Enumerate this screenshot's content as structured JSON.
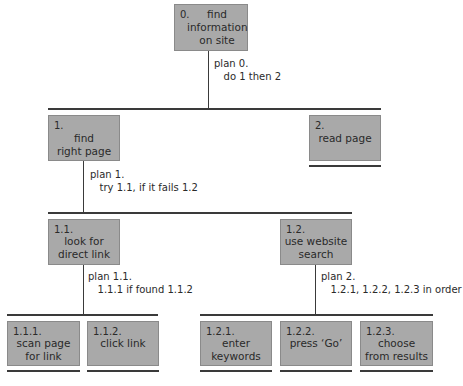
{
  "diagram": {
    "type": "hierarchical task analysis",
    "nodes": {
      "n0": {
        "num": "0.",
        "label": "find\ninformation\non site"
      },
      "n1": {
        "num": "1.",
        "label": "find\nright page"
      },
      "n2": {
        "num": "2.",
        "label": "read page"
      },
      "n11": {
        "num": "1.1.",
        "label": "look for\ndirect link"
      },
      "n12": {
        "num": "1.2.",
        "label": "use website\nsearch"
      },
      "n111": {
        "num": "1.1.1.",
        "label": "scan page\nfor link"
      },
      "n112": {
        "num": "1.1.2.",
        "label": "click link"
      },
      "n121": {
        "num": "1.2.1.",
        "label": "enter\nkeywords"
      },
      "n122": {
        "num": "1.2.2.",
        "label": "press ‘Go’"
      },
      "n123": {
        "num": "1.2.3.",
        "label": "choose\nfrom results"
      }
    },
    "plans": {
      "p0": {
        "title": "plan 0.",
        "body": "do 1 then 2"
      },
      "p1": {
        "title": "plan 1.",
        "body": "try 1.1, if it fails 1.2"
      },
      "p11": {
        "title": "plan 1.1.",
        "body": "1.1.1 if found 1.1.2"
      },
      "p2": {
        "title": "plan 2.",
        "body": "1.2.1, 1.2.2, 1.2.3 in order"
      }
    },
    "colors": {
      "box_fill": "#a9a9a9",
      "line": "#3a3a3a"
    }
  }
}
